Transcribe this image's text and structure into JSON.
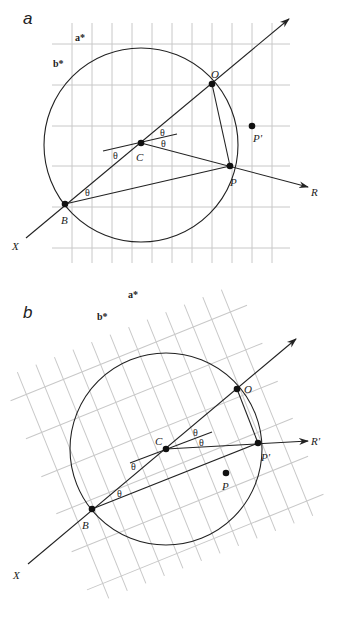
{
  "panels": [
    {
      "id": "a",
      "label": "a",
      "axis_labels": {
        "a_star": "a*",
        "b_star": "b*"
      },
      "points": {
        "O": "O",
        "C": "C",
        "P": "P",
        "P_prime": "P'",
        "B": "B",
        "X": "X",
        "R": "R"
      },
      "angle_symbol": "θ",
      "angle_labels": [
        "θ",
        "θ",
        "θ",
        "θ"
      ]
    },
    {
      "id": "b",
      "label": "b",
      "axis_labels": {
        "a_star": "a*",
        "b_star": "b*"
      },
      "points": {
        "O": "O",
        "C": "C",
        "P": "P",
        "P_prime": "P'",
        "B": "B",
        "X": "X",
        "R_prime": "R'"
      },
      "angle_symbol": "θ",
      "angle_labels": [
        "θ",
        "θ",
        "θ",
        "θ"
      ]
    }
  ],
  "colors": {
    "grid": "#c8c8c8",
    "lines": "#222222",
    "points": "#111111"
  }
}
